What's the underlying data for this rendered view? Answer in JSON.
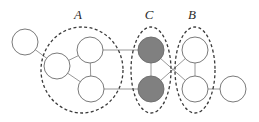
{
  "figure": {
    "width": 259,
    "height": 122,
    "background_color": "#ffffff"
  },
  "style": {
    "node_stroke": "#6b6b6b",
    "node_stroke_width": 0.9,
    "node_fill_empty": "#ffffff",
    "node_fill_shaded": "#808080",
    "edge_color": "#8c8c8c",
    "edge_width": 0.9,
    "group_stroke": "#3a3a3a",
    "group_stroke_width": 1.3,
    "group_dash": "3,2.4",
    "label_color": "#2b2b2b"
  },
  "labels": [
    {
      "id": "label-a",
      "text": "A",
      "x": 78,
      "y": 19
    },
    {
      "id": "label-c",
      "text": "C",
      "x": 149,
      "y": 19
    },
    {
      "id": "label-b",
      "text": "B",
      "x": 192,
      "y": 19
    }
  ],
  "groups": [
    {
      "id": "group-a",
      "label": "A",
      "shape": "ellipse",
      "cx": 82,
      "cy": 70,
      "rx": 41,
      "ry": 43,
      "members": [
        "node-a-left",
        "node-a-top",
        "node-a-bottom"
      ]
    },
    {
      "id": "group-c",
      "label": "C",
      "shape": "ellipse",
      "cx": 151,
      "cy": 70,
      "rx": 20,
      "ry": 43,
      "members": [
        "node-c-top",
        "node-c-bottom"
      ]
    },
    {
      "id": "group-b",
      "label": "B",
      "shape": "ellipse",
      "cx": 195,
      "cy": 70,
      "rx": 20,
      "ry": 43,
      "members": [
        "node-b-top",
        "node-b-bottom"
      ]
    }
  ],
  "nodes": [
    {
      "id": "node-outer-left",
      "cx": 25,
      "cy": 42,
      "r": 13,
      "fill": "empty",
      "group": null
    },
    {
      "id": "node-a-left",
      "cx": 57,
      "cy": 66,
      "r": 13,
      "fill": "empty",
      "group": "group-a"
    },
    {
      "id": "node-a-top",
      "cx": 90,
      "cy": 50,
      "r": 13,
      "fill": "empty",
      "group": "group-a"
    },
    {
      "id": "node-a-bottom",
      "cx": 91,
      "cy": 89,
      "r": 13,
      "fill": "empty",
      "group": "group-a"
    },
    {
      "id": "node-c-top",
      "cx": 151,
      "cy": 50,
      "r": 13,
      "fill": "shaded",
      "group": "group-c"
    },
    {
      "id": "node-c-bottom",
      "cx": 151,
      "cy": 89,
      "r": 13,
      "fill": "shaded",
      "group": "group-c"
    },
    {
      "id": "node-b-top",
      "cx": 195,
      "cy": 50,
      "r": 13,
      "fill": "empty",
      "group": "group-b"
    },
    {
      "id": "node-b-bottom",
      "cx": 195,
      "cy": 89,
      "r": 13,
      "fill": "empty",
      "group": "group-b"
    },
    {
      "id": "node-outer-right",
      "cx": 233,
      "cy": 89,
      "r": 13,
      "fill": "empty",
      "group": null
    }
  ],
  "edges": [
    {
      "id": "edge-outerleft-aleft",
      "source": "node-outer-left",
      "target": "node-a-left"
    },
    {
      "id": "edge-aleft-atop",
      "source": "node-a-left",
      "target": "node-a-top"
    },
    {
      "id": "edge-aleft-abottom",
      "source": "node-a-left",
      "target": "node-a-bottom"
    },
    {
      "id": "edge-atop-abottom",
      "source": "node-a-top",
      "target": "node-a-bottom"
    },
    {
      "id": "edge-atop-ctop",
      "source": "node-a-top",
      "target": "node-c-top"
    },
    {
      "id": "edge-abottom-cbottom",
      "source": "node-a-bottom",
      "target": "node-c-bottom"
    },
    {
      "id": "edge-ctop-cbottom",
      "source": "node-c-top",
      "target": "node-c-bottom"
    },
    {
      "id": "edge-ctop-bbottom",
      "source": "node-c-top",
      "target": "node-b-bottom"
    },
    {
      "id": "edge-cbottom-btop",
      "source": "node-c-bottom",
      "target": "node-b-top"
    },
    {
      "id": "edge-btop-bbottom",
      "source": "node-b-top",
      "target": "node-b-bottom"
    },
    {
      "id": "edge-bbottom-outerright",
      "source": "node-b-bottom",
      "target": "node-outer-right"
    }
  ]
}
